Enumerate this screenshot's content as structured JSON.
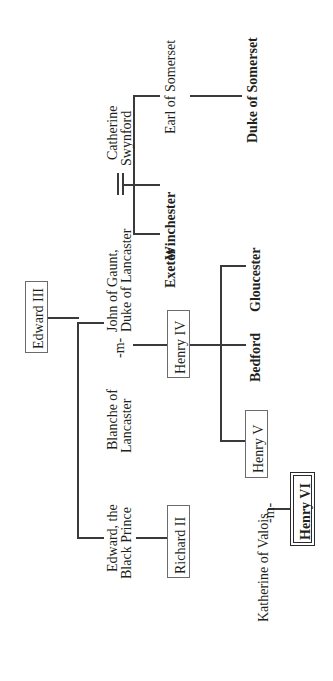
{
  "diagram": {
    "orientation": "rotated-90-ccw",
    "line_color": "#3a3a3a",
    "box_border_color": "#6b6b6b",
    "text_color": "#231f20",
    "marriage_symbol": "=",
    "marriage_abbrev": "-m-"
  },
  "nodes": {
    "edward_iii": {
      "label": "Edward III",
      "style": "boxed"
    },
    "john_of_gaunt": {
      "label": "John of Gaunt,\nDuke of Lancaster",
      "line1": "John of Gaunt,",
      "line2": "Duke of Lancaster",
      "style": "plain"
    },
    "blanche": {
      "label": "Blanche of\nLancaster",
      "line1": "Blanche of",
      "line2": "Lancaster",
      "style": "plain"
    },
    "catherine_swynford": {
      "label": "Catherine\nSwynford",
      "line1": "Catherine",
      "line2": "Swynford",
      "style": "plain"
    },
    "black_prince": {
      "label": "Edward, the\nBlack Prince",
      "line1": "Edward, the",
      "line2": "Black Prince",
      "style": "plain"
    },
    "richard_ii": {
      "label": "Richard II",
      "style": "boxed"
    },
    "henry_iv": {
      "label": "Henry IV",
      "style": "boxed"
    },
    "henry_v": {
      "label": "Henry V",
      "style": "boxed"
    },
    "henry_vi": {
      "label": "Henry VI",
      "style": "boxed-bold-double"
    },
    "katherine_valois": {
      "label": "Katherine of Valois",
      "style": "plain"
    },
    "exeter": {
      "label": "Exeter",
      "style": "bold"
    },
    "winchester": {
      "label": "Winchester",
      "style": "bold"
    },
    "earl_of_somerset": {
      "label": "Earl of Somerset",
      "style": "plain"
    },
    "duke_of_somerset": {
      "label": "Duke of Somerset",
      "style": "bold"
    },
    "bedford": {
      "label": "Bedford",
      "style": "bold"
    },
    "gloucester": {
      "label": "Gloucester",
      "style": "bold"
    },
    "marriage_1": {
      "label": "-m-"
    },
    "marriage_2": {
      "label": "-m-"
    }
  }
}
